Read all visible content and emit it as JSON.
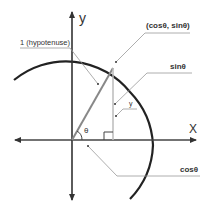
{
  "diagram": {
    "axes": {
      "x_label": "X",
      "y_label": "y"
    },
    "angle_label": "θ",
    "labels": {
      "hypotenuse": "1 (hypotenuse)",
      "point": "(cosθ, sinθ)",
      "sin": "sinθ",
      "y": "y",
      "cos": "cosθ"
    },
    "colors": {
      "axis": "#333333",
      "circle": "#222222",
      "hypotenuse": "#888888",
      "vertical": "#bbbbbb",
      "leader": "#999999"
    }
  }
}
